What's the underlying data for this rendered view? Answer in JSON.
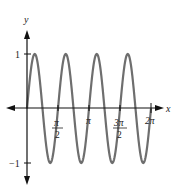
{
  "chart_data": {
    "type": "line",
    "title": "",
    "function": "y = sin(4x)",
    "xlabel": "x",
    "ylabel": "y",
    "xlim": [
      0,
      6.2832
    ],
    "ylim": [
      -1,
      1
    ],
    "grid": false,
    "legend": null,
    "x_ticks": [
      {
        "value": 1.5708,
        "label_num": "π",
        "label_den": "2"
      },
      {
        "value": 3.1416,
        "label": "π"
      },
      {
        "value": 4.7124,
        "label_num": "3π",
        "label_den": "2"
      },
      {
        "value": 6.2832,
        "label": "2π"
      }
    ],
    "y_ticks": [
      {
        "value": 1,
        "label": "1"
      },
      {
        "value": -1,
        "label": "−1"
      }
    ],
    "series": [
      {
        "name": "sin(4x)",
        "color": "#6e6e6e",
        "x": [
          0,
          0.3927,
          0.7854,
          1.1781,
          1.5708,
          1.9635,
          2.3562,
          2.7489,
          3.1416,
          3.5343,
          3.927,
          4.3197,
          4.7124,
          5.1051,
          5.4978,
          5.8905,
          6.2832
        ],
        "y": [
          0,
          1,
          0,
          -1,
          0,
          1,
          0,
          -1,
          0,
          1,
          0,
          -1,
          0,
          1,
          0,
          -1,
          0
        ]
      }
    ]
  },
  "labels": {
    "y_axis": "y",
    "x_axis": "x",
    "y_tick_pos": "1",
    "y_tick_neg": "−1",
    "x_tick_pi_half_num": "π",
    "x_tick_pi_half_den": "2",
    "x_tick_pi": "π",
    "x_tick_3pi_half_num": "3π",
    "x_tick_3pi_half_den": "2",
    "x_tick_2pi": "2π"
  },
  "colors": {
    "axis": "#111111",
    "curve": "#6e6e6e"
  }
}
